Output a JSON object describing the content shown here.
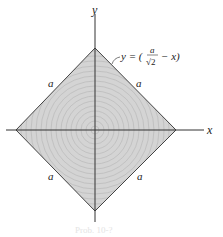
{
  "figure": {
    "axes": {
      "x_label": "x",
      "y_label": "y"
    },
    "shape": {
      "type": "square rotated 45 degrees (diamond) with concentric circle shading",
      "side_labels": [
        "a",
        "a",
        "a",
        "a"
      ],
      "fill_color": "#d4d4d4",
      "edge_color": "#444444"
    },
    "equation": {
      "lhs": "y = (",
      "numerator": "a",
      "denominator": "√2",
      "rest": "− x)"
    },
    "caption": "Prob. 10-?"
  },
  "colors": {
    "axis": "#333333",
    "ring": "#b8b8b8"
  }
}
